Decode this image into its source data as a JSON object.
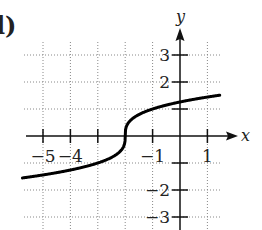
{
  "figure": {
    "panel_label": "l)",
    "x_axis_label": "x",
    "y_axis_label": "y",
    "x_tick_labels": [
      {
        "value": -5,
        "text": "−5"
      },
      {
        "value": -4,
        "text": "−4"
      },
      {
        "value": -1,
        "text": "−1"
      },
      {
        "value": 1,
        "text": "1"
      }
    ],
    "y_tick_labels": [
      {
        "value": 3,
        "text": "3"
      },
      {
        "value": 2,
        "text": "2"
      },
      {
        "value": -2,
        "text": "−2"
      },
      {
        "value": -3,
        "text": "−3"
      }
    ]
  },
  "chart_data": {
    "type": "line",
    "title": "",
    "xlabel": "x",
    "ylabel": "y",
    "function": "y = cbrt(x + 2)",
    "xlim": [
      -5.7,
      1.5
    ],
    "ylim": [
      -3.4,
      3.6
    ],
    "grid": true,
    "grid_style": "dotted",
    "x_ticks": [
      -5,
      -4,
      -3,
      -2,
      -1,
      0,
      1
    ],
    "y_ticks": [
      -3,
      -2,
      -1,
      0,
      1,
      2,
      3
    ],
    "series": [
      {
        "name": "curve",
        "x": [
          -5.5,
          -5,
          -4,
          -3,
          -2.5,
          -2.1,
          -2,
          -1.9,
          -1.5,
          -1,
          0,
          1,
          1.4
        ],
        "y": [
          -1.52,
          -1.44,
          -1.26,
          -1.0,
          -0.79,
          -0.46,
          0,
          0.46,
          0.79,
          1.0,
          1.26,
          1.44,
          1.5
        ]
      }
    ]
  }
}
